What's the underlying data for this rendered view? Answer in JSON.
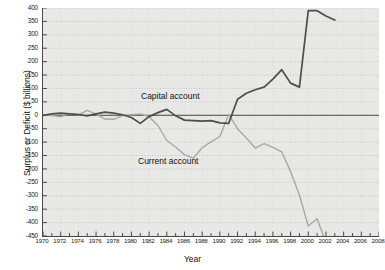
{
  "chart_data": {
    "type": "line",
    "title": "",
    "xlabel": "Year",
    "ylabel": "Surplus or Deficit ($ billions)",
    "xlim": [
      1970,
      2008
    ],
    "ylim": [
      -450,
      400
    ],
    "ytick_step": 50,
    "xtick_step": 2,
    "grid": true,
    "grid_style": "dotted-horizontal",
    "legend_position": "inline-annotation",
    "zero_line": 0,
    "yticks": [
      400,
      350,
      300,
      250,
      200,
      150,
      100,
      50,
      0,
      -50,
      -100,
      -150,
      -200,
      -250,
      -300,
      -350,
      -400,
      -450
    ],
    "xticks": [
      1970,
      1972,
      1974,
      1976,
      1978,
      1980,
      1982,
      1984,
      1986,
      1988,
      1990,
      1992,
      1994,
      1996,
      1998,
      2000,
      2002,
      2004,
      2006,
      2008
    ],
    "x": [
      1970,
      1971,
      1972,
      1973,
      1974,
      1975,
      1976,
      1977,
      1978,
      1979,
      1980,
      1981,
      1982,
      1983,
      1984,
      1985,
      1986,
      1987,
      1988,
      1989,
      1990,
      1991,
      1992,
      1993,
      1994,
      1995,
      1996,
      1997,
      1998,
      1999,
      2000,
      2001,
      2002,
      2003
    ],
    "series": [
      {
        "name": "Capital account",
        "color": "#4d4d4d",
        "values": [
          0,
          5,
          8,
          5,
          3,
          -2,
          5,
          12,
          8,
          2,
          -8,
          -30,
          -5,
          10,
          22,
          -2,
          -18,
          -20,
          -22,
          -20,
          -28,
          -30,
          60,
          82,
          95,
          105,
          135,
          170,
          120,
          105,
          390,
          390,
          370,
          355
        ]
      },
      {
        "name": "Current account",
        "color": "#a8a8a8",
        "values": [
          2,
          -1,
          -6,
          7,
          2,
          18,
          4,
          -14,
          -15,
          -1,
          2,
          5,
          -5,
          -38,
          -94,
          -118,
          -147,
          -160,
          -121,
          -99,
          -79,
          3,
          -50,
          -85,
          -122,
          -106,
          -120,
          -136,
          -210,
          -297,
          -413,
          -386,
          -474,
          -530
        ]
      }
    ],
    "annotations": [
      {
        "text": "Capital account",
        "x": 1987,
        "y": 210
      },
      {
        "text": "Current account",
        "x": 1986,
        "y": -115
      }
    ]
  },
  "axes": {
    "y_title": "Surplus or Deficit ($ billions)",
    "x_title": "Year",
    "ytick_labels": [
      "400",
      "350",
      "300",
      "250",
      "200",
      "150",
      "100",
      "50",
      "0",
      "-50",
      "-100",
      "-150",
      "-200",
      "-250",
      "-300",
      "-350",
      "-400",
      "-450"
    ],
    "xtick_labels": [
      "1970",
      "1972",
      "1974",
      "1976",
      "1978",
      "1980",
      "1982",
      "1984",
      "1986",
      "1988",
      "1990",
      "1992",
      "1994",
      "1996",
      "1998",
      "2000",
      "2002",
      "2004",
      "2006",
      "2008"
    ]
  },
  "labels": {
    "capital": "Capital account",
    "current": "Current account"
  },
  "colors": {
    "capital_line": "#4d4d4d",
    "current_line": "#a8a8a8",
    "plot_background": "#e8e8e6",
    "axis": "#4a4a4a",
    "grid": "#b0b0ae",
    "text": "#1a1a1a"
  }
}
